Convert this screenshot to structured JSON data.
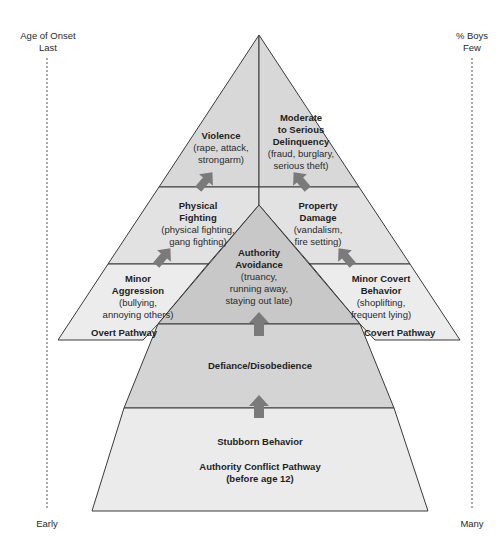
{
  "axes": {
    "left": {
      "top_line1": "Age of Onset",
      "top_line2": "Last",
      "bottom": "Early"
    },
    "right": {
      "top_line1": "% Boys",
      "top_line2": "Few",
      "bottom": "Many"
    }
  },
  "overt": {
    "pathway_label": "Overt Pathway",
    "violence": {
      "title": "Violence",
      "detail": "(rape, attack, strongarm)",
      "detail_l1": "(rape, attack,",
      "detail_l2": "strongarm)"
    },
    "physical_fighting": {
      "title_l1": "Physical",
      "title_l2": "Fighting",
      "detail_l1": "(physical fighting,",
      "detail_l2": "gang fighting)"
    },
    "minor_aggression": {
      "title_l1": "Minor",
      "title_l2": "Aggression",
      "detail_l1": "(bullying,",
      "detail_l2": "annoying others)"
    }
  },
  "covert": {
    "pathway_label": "Covert Pathway",
    "delinquency": {
      "title_l1": "Moderate",
      "title_l2": "to Serious",
      "title_l3": "Delinquency",
      "detail_l1": "(fraud, burglary,",
      "detail_l2": "serious theft)"
    },
    "property_damage": {
      "title_l1": "Property",
      "title_l2": "Damage",
      "detail_l1": "(vandalism,",
      "detail_l2": "fire setting)"
    },
    "minor_covert": {
      "title_l1": "Minor Covert",
      "title_l2": "Behavior",
      "detail_l1": "(shoplifting,",
      "detail_l2": "frequent lying)"
    }
  },
  "authority": {
    "avoidance": {
      "title_l1": "Authority",
      "title_l2": "Avoidance",
      "detail_l1": "(truancy,",
      "detail_l2": "running away,",
      "detail_l3": "staying out late)"
    },
    "defiance": {
      "title": "Defiance/Disobedience"
    },
    "stubborn": {
      "title": "Stubborn Behavior"
    },
    "pathway_label_l1": "Authority Conflict Pathway",
    "pathway_label_l2": "(before age 12)"
  },
  "colors": {
    "light_fill": "#e8e8e8",
    "mid_fill": "#d6d6d6",
    "dark_fill": "#c4c4c4",
    "stroke": "#3a3a3a",
    "arrow": "#7a7a7a"
  }
}
